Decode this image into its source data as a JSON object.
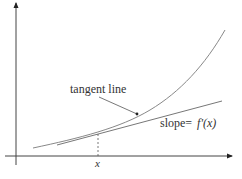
{
  "diagram": {
    "labels": {
      "tangent_line": "tangent line",
      "slope_prefix": "slope=",
      "slope_expr": "f'(x)",
      "x_tick": "x"
    },
    "colors": {
      "axis": "#333333",
      "curve": "#888888",
      "tangent": "#777777",
      "text": "#333333"
    }
  }
}
